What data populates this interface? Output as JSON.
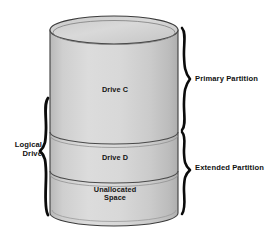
{
  "diagram": {
    "type": "cylinder-partition-diagram",
    "colors": {
      "cylinder_fill": "#d4d4d4",
      "cylinder_top_fill": "#cfcfcf",
      "outline": "#3a3a3a",
      "brace": "#0b0b0b",
      "text": "#111111",
      "background": "#ffffff"
    },
    "cylinder": {
      "name": "hard-disk-cylinder",
      "segments": [
        {
          "id": "drive-c",
          "label": "Drive C",
          "order": 1
        },
        {
          "id": "drive-d",
          "label": "Drive D",
          "order": 2
        },
        {
          "id": "unallocated",
          "label": "Unallocated\nSpace",
          "order": 3
        }
      ]
    },
    "annotations": {
      "right": [
        {
          "id": "primary-partition",
          "label": "Primary Partition",
          "brace": "right-brace",
          "spans": [
            "drive-c"
          ]
        },
        {
          "id": "extended-partition",
          "label": "Extended Partition",
          "brace": "right-brace",
          "spans": [
            "drive-d",
            "unallocated"
          ]
        }
      ],
      "left": [
        {
          "id": "logical-drive",
          "label": "Logical\nDrive",
          "brace": "left-brace",
          "spans": [
            "drive-c",
            "drive-d",
            "unallocated"
          ]
        }
      ]
    }
  }
}
